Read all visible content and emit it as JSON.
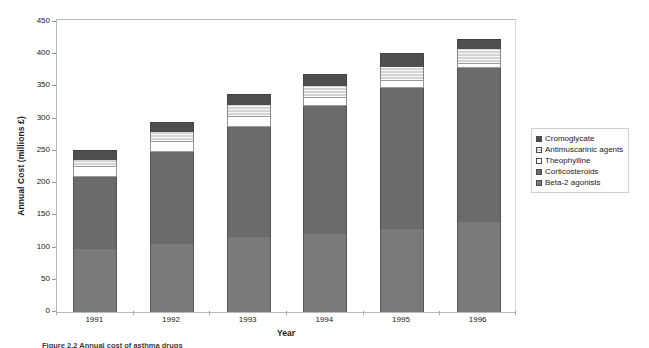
{
  "chart_data": {
    "type": "bar",
    "subtype": "stacked-vertical",
    "title": "",
    "xlabel": "Year",
    "ylabel": "Annual Cost (millions £)",
    "categories": [
      "1991",
      "1992",
      "1993",
      "1994",
      "1995",
      "1996"
    ],
    "ylim": [
      0,
      450
    ],
    "ytick_values": [
      0,
      50,
      100,
      150,
      200,
      250,
      300,
      350,
      400,
      450
    ],
    "ytick_labels": [
      "0",
      "50",
      "100",
      "150",
      "200",
      "250",
      "300",
      "350",
      "400",
      "450"
    ],
    "grid": false,
    "legend_position": "right",
    "stack_order_bottom_to_top": [
      "Beta-2 agonists",
      "Corticosteroids",
      "Theophylline",
      "Antimuscarinic agents",
      "Cromoglycate"
    ],
    "series": [
      {
        "name": "Beta-2 agonists",
        "color": "#7a7a7a",
        "pattern": "solid",
        "values": [
          98,
          105,
          117,
          121,
          129,
          140
        ]
      },
      {
        "name": "Corticosteroids",
        "color": "#6b6b6b",
        "pattern": "solid",
        "values": [
          111,
          144,
          170,
          199,
          219,
          238
        ]
      },
      {
        "name": "Theophylline",
        "color": "#ffffff",
        "pattern": "open",
        "values": [
          17,
          17,
          17,
          14,
          12,
          9
        ]
      },
      {
        "name": "Antimuscarinic agents",
        "color": "#d4d4d4",
        "pattern": "light-hatch",
        "values": [
          10,
          13,
          17,
          17,
          20,
          21
        ]
      },
      {
        "name": "Cromoglycate",
        "color": "#4f4f4f",
        "pattern": "solid",
        "values": [
          15,
          16,
          17,
          18,
          22,
          15
        ]
      }
    ],
    "totals": [
      251,
      295,
      338,
      369,
      402,
      423
    ],
    "cumulative_tops": {
      "1991": [
        98,
        209,
        226,
        236,
        251
      ],
      "1992": [
        105,
        249,
        266,
        279,
        295
      ],
      "1993": [
        117,
        287,
        304,
        321,
        338
      ],
      "1994": [
        121,
        320,
        334,
        351,
        369
      ],
      "1995": [
        129,
        348,
        360,
        380,
        402
      ],
      "1996": [
        140,
        378,
        387,
        408,
        423
      ]
    }
  },
  "legend": {
    "items": [
      {
        "label": "Cromoglycate",
        "swatch": "legend-swatch-cromoglycate"
      },
      {
        "label": "Antimuscarinic agents",
        "swatch": "legend-swatch-antimuscarinic"
      },
      {
        "label": "Theophylline",
        "swatch": "legend-swatch-theophylline"
      },
      {
        "label": "Corticosteroids",
        "swatch": "legend-swatch-corticosteroids"
      },
      {
        "label": "Beta-2 agonists",
        "swatch": "legend-swatch-beta2"
      }
    ]
  },
  "caption": {
    "text": "Figure 2.2  Annual cost of asthma drugs"
  }
}
